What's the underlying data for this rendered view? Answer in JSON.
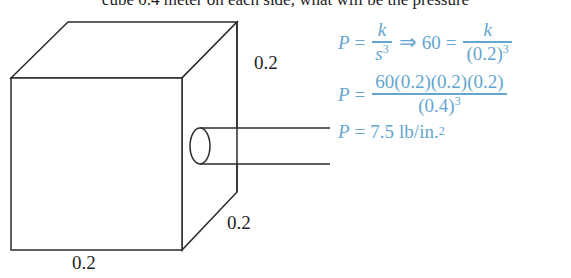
{
  "problem": {
    "text": "cube 0.4 meter on each side, what will be the pressure"
  },
  "figure": {
    "name": "cube-with-pipe-diagram",
    "stroke_color": "#2b2b2b",
    "fill_color": "#ffffff",
    "shapes": [
      "cube",
      "cylindrical-pipe",
      "vertical-dimension-line"
    ]
  },
  "dimensions": {
    "right_top": "0.2",
    "right_bottom": "0.2",
    "bottom": "0.2"
  },
  "solution": {
    "accent_color": "#64a6cf",
    "line1": {
      "var": "P",
      "equals": "=",
      "frac1_num": "k",
      "frac1_den_base": "s",
      "frac1_den_exp": "3",
      "implies": "⇒",
      "value": "60",
      "equals2": "=",
      "frac2_num": "k",
      "frac2_den_base": "(0.2)",
      "frac2_den_exp": "3"
    },
    "line2": {
      "var": "P",
      "equals": "=",
      "num": "60(0.2)(0.2)(0.2)",
      "den_base": "(0.4)",
      "den_exp": "3"
    },
    "line3": {
      "var": "P",
      "equals": "=",
      "value": "7.5",
      "unit": "lb/in.",
      "unit_exp": "2"
    }
  }
}
